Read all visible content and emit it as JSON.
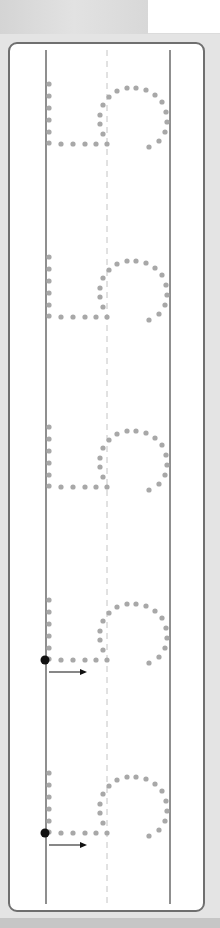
{
  "worksheet": {
    "type": "number-tracing",
    "digit": "5",
    "orientation": "rotated-90",
    "repetitions": 5,
    "guide_lines": {
      "solid_left_x": 44,
      "dashed_mid_x": 106,
      "solid_right_x": 168
    },
    "glyph_offsets_y": [
      0,
      173,
      343,
      516,
      689
    ],
    "start_markers": [
      {
        "glyph_index": 3,
        "has_arrow": true
      },
      {
        "glyph_index": 4,
        "has_arrow": true
      }
    ],
    "colors": {
      "dot": "#a8a8a8",
      "line": "#6a6a6a",
      "dashed": "#c4c4c4",
      "marker": "#111111",
      "frame": "#6f6f6f"
    }
  }
}
